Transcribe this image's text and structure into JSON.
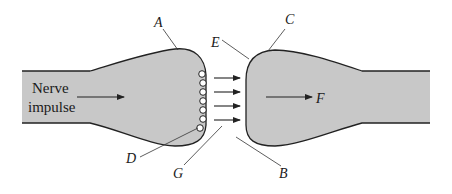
{
  "diagram": {
    "type": "synapse",
    "fill_color": "#c8c8c8",
    "stroke_color": "#222222",
    "caption_text": {
      "line1": "Nerve",
      "line2": "impulse"
    },
    "labels": {
      "A": "A",
      "B": "B",
      "C": "C",
      "D": "D",
      "E": "E",
      "F": "F",
      "G": "G"
    },
    "vesicle_count": 7,
    "cleft_arrow_count": 4
  }
}
